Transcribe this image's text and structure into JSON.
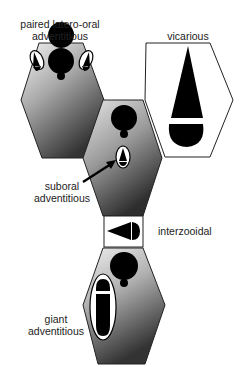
{
  "labels": {
    "paired_latero_oral": [
      "paired latero-oral",
      "adventitious"
    ],
    "vicarious": "vicarious",
    "suboral": [
      "suboral",
      "adventitious"
    ],
    "interzooidal": "interzooidal",
    "giant": [
      "giant",
      "adventitious"
    ]
  },
  "colors": {
    "outline": "#222222",
    "fill_black": "#000000",
    "gradient_light": "#f2f2f2",
    "gradient_dark": "#3a3a3a",
    "background": "#ffffff"
  },
  "structures": [
    {
      "id": "zooid-top-left",
      "type": "autozooid",
      "avicularium": "paired latero-oral adventitious"
    },
    {
      "id": "vicarious-zooid",
      "type": "vicarious avicularium"
    },
    {
      "id": "zooid-middle",
      "type": "autozooid",
      "avicularium": "suboral adventitious"
    },
    {
      "id": "interzooidal-avicularium",
      "type": "interzooidal avicularium"
    },
    {
      "id": "zooid-bottom",
      "type": "autozooid",
      "avicularium": "giant adventitious"
    }
  ]
}
